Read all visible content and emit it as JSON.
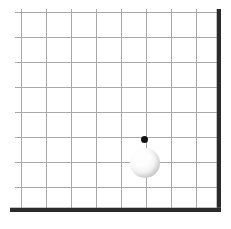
{
  "figure": {
    "background_color": "#ffffff",
    "width": 231,
    "height": 229
  },
  "grid": {
    "line_color": "#a8a8a8",
    "columns": 8,
    "rows": 8,
    "spacing_px": 25,
    "origin_x": 21,
    "origin_y": 12,
    "vertical_x": [
      21,
      46,
      71,
      96,
      121,
      146,
      171,
      196
    ],
    "horizontal_y": [
      12,
      37,
      62,
      87,
      112,
      137,
      162,
      187
    ]
  },
  "borders": {
    "wall": {
      "name": "right wall",
      "color": "#2b2b2b",
      "x": 217,
      "y": 9,
      "width": 4,
      "height": 203
    },
    "ground": {
      "name": "bottom ground",
      "color": "#2b2b2b",
      "x": 10,
      "y": 208,
      "width": 211,
      "height": 4
    }
  },
  "pendulum": {
    "pivot": {
      "label": "pivot point",
      "color": "#111111",
      "x": 144,
      "y": 139,
      "diameter": 7
    },
    "bob": {
      "label": "ball",
      "highlight_color": "#ffffff",
      "shade_color": "#bdbdbd",
      "center_x": 145,
      "center_y": 163,
      "diameter": 30
    }
  },
  "chart_data": {
    "type": "scatter",
    "xlabel": "",
    "ylabel": "",
    "grid": true,
    "legend": "none",
    "xlim": [
      0,
      8
    ],
    "ylim": [
      0,
      8
    ],
    "categories": [
      "pivot",
      "bob"
    ],
    "series": [
      {
        "name": "pivot point",
        "x": [
          4.92
        ],
        "y": [
          2.92
        ],
        "values": [
          2.92
        ],
        "marker": "filled-circle",
        "color": "#111111",
        "size_px": 7
      },
      {
        "name": "ball",
        "x": [
          4.96
        ],
        "y": [
          1.96
        ],
        "values": [
          1.96
        ],
        "marker": "shaded-sphere",
        "color": "#ffffff",
        "size_px": 30
      }
    ]
  }
}
